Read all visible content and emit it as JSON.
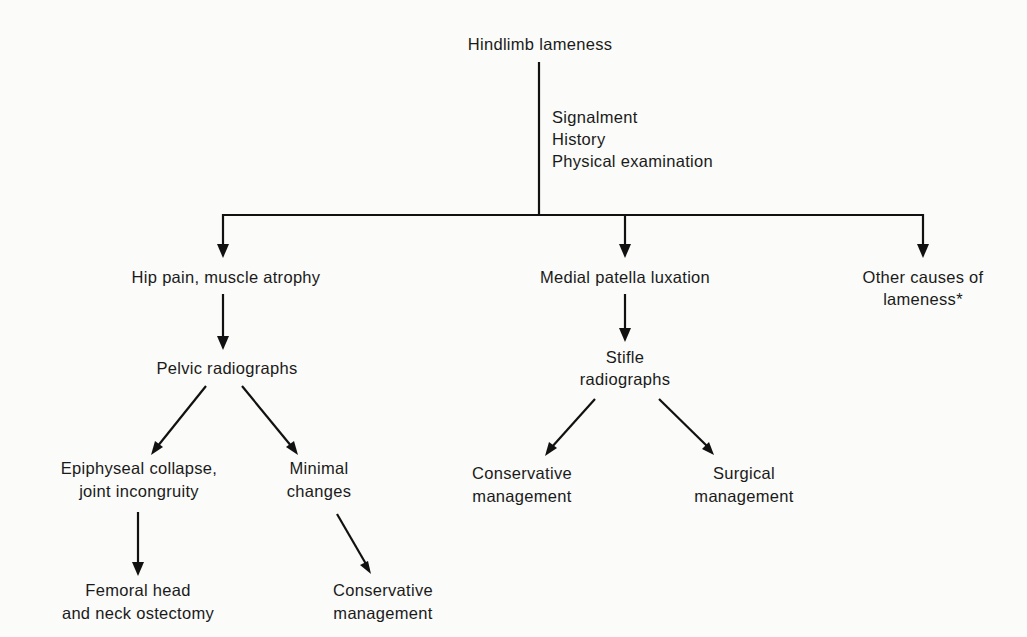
{
  "diagram": {
    "title": "Hindlimb lameness",
    "workup": [
      "Signalment",
      "History",
      "Physical examination"
    ],
    "branches": {
      "hip": {
        "label": "Hip pain, muscle atrophy",
        "test": "Pelvic radiographs",
        "left": {
          "label": [
            "Epiphyseal collapse,",
            "joint incongruity"
          ],
          "outcome": [
            "Femoral head",
            "and neck ostectomy"
          ]
        },
        "right": {
          "label": [
            "Minimal",
            "changes"
          ],
          "outcome": [
            "Conservative",
            "management"
          ]
        }
      },
      "patella": {
        "label": "Medial patella luxation",
        "test": [
          "Stifle",
          "radiographs"
        ],
        "left": [
          "Conservative",
          "management"
        ],
        "right": [
          "Surgical",
          "management"
        ]
      },
      "other": {
        "label": [
          "Other causes of",
          "lameness*"
        ]
      }
    },
    "colors": {
      "line": "#111111",
      "text": "#1a1a1a",
      "background": "#fbfbf9"
    }
  }
}
